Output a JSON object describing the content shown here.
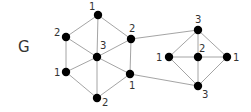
{
  "graph": {
    "name": "G",
    "name_pos": [
      18,
      52
    ],
    "colors": {
      "edge": "#9a9a9a",
      "node": "#000000",
      "label": "#333333"
    },
    "nodes": [
      {
        "id": "L_top",
        "label": "1",
        "x": 98,
        "y": 15,
        "lx": 89,
        "ly": 10
      },
      {
        "id": "L_ul",
        "label": "2",
        "x": 66,
        "y": 37,
        "lx": 54,
        "ly": 36
      },
      {
        "id": "L_ur",
        "label": "2",
        "x": 131,
        "y": 39,
        "lx": 129,
        "ly": 32
      },
      {
        "id": "L_center",
        "label": "3",
        "x": 97,
        "y": 57,
        "lx": 100,
        "ly": 49
      },
      {
        "id": "L_ll",
        "label": "1",
        "x": 66,
        "y": 72,
        "lx": 54,
        "ly": 76
      },
      {
        "id": "L_lr",
        "label": "1",
        "x": 130,
        "y": 74,
        "lx": 129,
        "ly": 89
      },
      {
        "id": "L_bottom",
        "label": "2",
        "x": 97,
        "y": 98,
        "lx": 102,
        "ly": 106
      },
      {
        "id": "R_top",
        "label": "3",
        "x": 198,
        "y": 30,
        "lx": 195,
        "ly": 23
      },
      {
        "id": "R_left",
        "label": "1",
        "x": 169,
        "y": 57,
        "lx": 156,
        "ly": 61
      },
      {
        "id": "R_center",
        "label": "2",
        "x": 198,
        "y": 57,
        "lx": 199,
        "ly": 52
      },
      {
        "id": "R_right",
        "label": "1",
        "x": 227,
        "y": 57,
        "lx": 233,
        "ly": 61
      },
      {
        "id": "R_bottom",
        "label": "3",
        "x": 198,
        "y": 86,
        "lx": 202,
        "ly": 98
      }
    ],
    "edges": [
      [
        "L_top",
        "L_ul"
      ],
      [
        "L_top",
        "L_ur"
      ],
      [
        "L_top",
        "L_center"
      ],
      [
        "L_ul",
        "L_center"
      ],
      [
        "L_ur",
        "L_center"
      ],
      [
        "L_ul",
        "L_ll"
      ],
      [
        "L_ur",
        "L_lr"
      ],
      [
        "L_center",
        "L_ll"
      ],
      [
        "L_center",
        "L_lr"
      ],
      [
        "L_center",
        "L_bottom"
      ],
      [
        "L_ll",
        "L_bottom"
      ],
      [
        "L_lr",
        "L_bottom"
      ],
      [
        "R_top",
        "R_left"
      ],
      [
        "R_top",
        "R_center"
      ],
      [
        "R_top",
        "R_right"
      ],
      [
        "R_left",
        "R_center"
      ],
      [
        "R_center",
        "R_right"
      ],
      [
        "R_left",
        "R_bottom"
      ],
      [
        "R_center",
        "R_bottom"
      ],
      [
        "R_right",
        "R_bottom"
      ],
      [
        "L_ur",
        "R_top"
      ],
      [
        "L_lr",
        "R_bottom"
      ]
    ]
  }
}
